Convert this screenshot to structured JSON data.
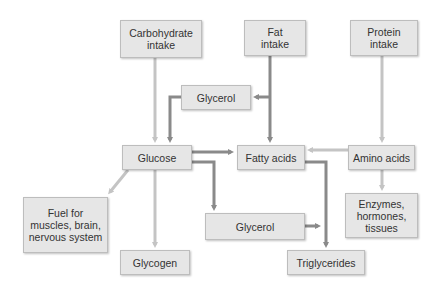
{
  "diagram": {
    "colors": {
      "box_fill": "#e6e6e6",
      "box_border": "#bdbdbd",
      "text": "#333333",
      "arrow_dark": "#8a8a8a",
      "arrow_light": "#c4c4c4"
    },
    "nodes": {
      "carbohydrate_intake": "Carbohydrate intake",
      "fat_intake": "Fat intake",
      "protein_intake": "Protein intake",
      "glycerol_top": "Glycerol",
      "glucose": "Glucose",
      "fatty_acids": "Fatty acids",
      "amino_acids": "Amino acids",
      "fuel": "Fuel for muscles, brain, nervous system",
      "enzymes": "Enzymes, hormones, tissues",
      "glycerol_bottom": "Glycerol",
      "glycogen": "Glycogen",
      "triglycerides": "Triglycerides"
    },
    "edges": [
      {
        "from": "Carbohydrate intake",
        "to": "Glucose",
        "style": "light"
      },
      {
        "from": "Fat intake",
        "to": "Fatty acids",
        "style": "dark"
      },
      {
        "from": "Fat intake",
        "to": "Glycerol",
        "style": "dark"
      },
      {
        "from": "Glycerol",
        "to": "Glucose",
        "style": "dark"
      },
      {
        "from": "Protein intake",
        "to": "Amino acids",
        "style": "light"
      },
      {
        "from": "Glucose",
        "to": "Fatty acids",
        "style": "dark"
      },
      {
        "from": "Amino acids",
        "to": "Fatty acids",
        "style": "light"
      },
      {
        "from": "Glucose",
        "to": "Fuel for muscles, brain, nervous system",
        "style": "light"
      },
      {
        "from": "Glucose",
        "to": "Glycogen",
        "style": "light"
      },
      {
        "from": "Glucose",
        "to": "Glycerol",
        "style": "dark"
      },
      {
        "from": "Amino acids",
        "to": "Enzymes, hormones, tissues",
        "style": "light"
      },
      {
        "from": "Fatty acids",
        "to": "Triglycerides",
        "style": "dark"
      },
      {
        "from": "Glycerol",
        "to": "Triglycerides",
        "style": "dark"
      }
    ]
  }
}
